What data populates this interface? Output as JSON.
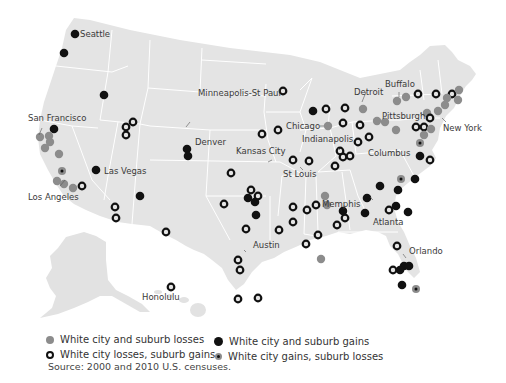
{
  "colors": {
    "land": "#e4e4e4",
    "borders": "#ffffff",
    "both_losses": "#8c8c8c",
    "city_loss_suburb_gain": "#111111",
    "both_gains": "#111111",
    "city_gain_suburb_loss": "#8c8c8c"
  },
  "legend": {
    "both_losses": "White city and suburb losses",
    "city_loss_suburb_gain": "White city losses, suburb gains",
    "both_gains": "White city and suburb gains",
    "city_gain_suburb_loss": "White city gains, suburb losses"
  },
  "source": "Source: 2000 and 2010 U.S. censuses.",
  "city_labels": [
    "Seattle",
    "San Francisco",
    "Los Angeles",
    "Las Vegas",
    "Denver",
    "Minneapolis-St Paul",
    "Kansas City",
    "St Louis",
    "Chicago",
    "Indianapolis",
    "Detroit",
    "Columbus",
    "Buffalo",
    "Pittsburgh",
    "New York",
    "Memphis",
    "Atlanta",
    "Austin",
    "Orlando",
    "Honolulu"
  ],
  "marker_counts": {
    "both_losses": 28,
    "city_loss_suburb_gain": 52,
    "both_gains": 30,
    "city_gain_suburb_loss": 5
  }
}
